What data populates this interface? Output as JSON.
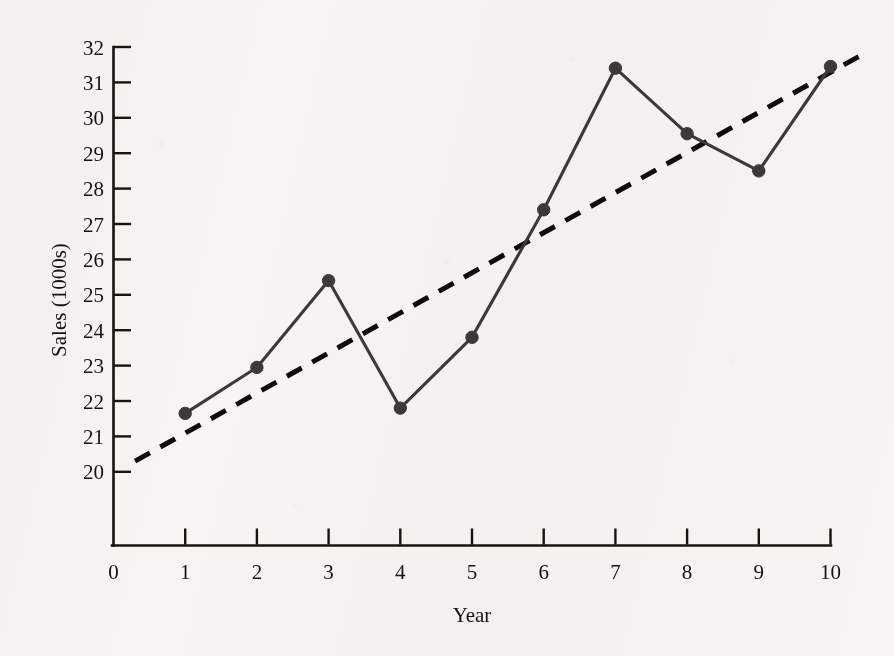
{
  "figure": {
    "background_color": "#f6f5f2",
    "ink_color": "#17140f",
    "series_color": "#3b3a36",
    "trend_color": "#0d0c0a"
  },
  "chart_data": {
    "type": "line",
    "title": "",
    "xlabel": "Year",
    "ylabel": "Sales (1000s)",
    "x": [
      1,
      2,
      3,
      4,
      5,
      6,
      7,
      8,
      9,
      10
    ],
    "xlim": [
      0,
      10
    ],
    "ylim": [
      20,
      32
    ],
    "y_axis_has_scale_break_below": 20,
    "grid": false,
    "legend": "none",
    "xticks": [
      "0",
      "1",
      "2",
      "3",
      "4",
      "5",
      "6",
      "7",
      "8",
      "9",
      "10"
    ],
    "yticks": [
      "20",
      "21",
      "22",
      "23",
      "24",
      "25",
      "26",
      "27",
      "28",
      "29",
      "30",
      "31",
      "32"
    ],
    "series": [
      {
        "name": "Sales",
        "style": "solid-with-round-markers",
        "values": [
          21.65,
          22.95,
          25.4,
          21.8,
          23.8,
          27.4,
          31.4,
          29.55,
          28.5,
          31.45
        ]
      },
      {
        "name": "Trend line",
        "style": "dashed",
        "x_endpoints": [
          0.3,
          10.5
        ],
        "y_endpoints": [
          20.3,
          31.85
        ]
      }
    ]
  }
}
